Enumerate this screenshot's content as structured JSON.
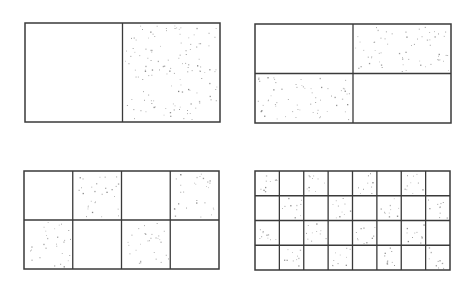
{
  "figure": {
    "line_color": "#3a3a3a",
    "dot_color": "#7a7a7a",
    "background": "#ffffff",
    "panels": [
      {
        "id": "panel-1x2",
        "x": 25,
        "y": 23,
        "w": 195,
        "h": 99,
        "cols": 2,
        "rows": 1,
        "first_cell_dotted": false,
        "dot_density": 0.0135
      },
      {
        "id": "panel-2x2",
        "x": 255,
        "y": 24,
        "w": 196,
        "h": 99,
        "cols": 2,
        "rows": 2,
        "first_cell_dotted": false,
        "dot_density": 0.0125
      },
      {
        "id": "panel-4x2",
        "x": 24,
        "y": 171,
        "w": 195,
        "h": 98,
        "cols": 4,
        "rows": 2,
        "first_cell_dotted": false,
        "dot_density": 0.0115
      },
      {
        "id": "panel-8x4",
        "x": 255,
        "y": 171,
        "w": 195,
        "h": 99,
        "cols": 8,
        "rows": 4,
        "first_cell_dotted": true,
        "dot_density": 0.0135
      }
    ]
  }
}
